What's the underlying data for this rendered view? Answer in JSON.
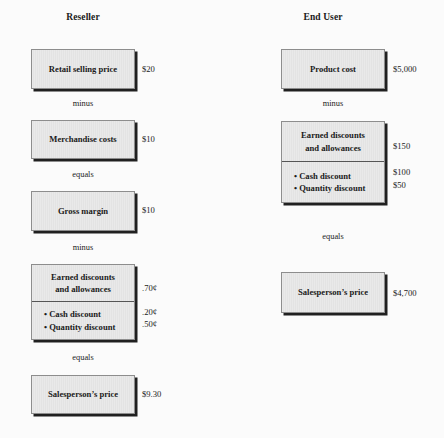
{
  "columns": [
    {
      "id": "reseller",
      "header": "Reseller",
      "boxes": [
        {
          "name": "retail-selling-price",
          "sections": [
            {
              "lines": [
                "Retail selling price"
              ]
            }
          ],
          "values": [
            "$20"
          ]
        },
        {
          "name": "merchandise-costs",
          "sections": [
            {
              "lines": [
                "Merchandise costs"
              ]
            }
          ],
          "values": [
            "$10"
          ]
        },
        {
          "name": "gross-margin",
          "sections": [
            {
              "lines": [
                "Gross margin"
              ]
            }
          ],
          "values": [
            "$10"
          ]
        },
        {
          "name": "earned-discounts-and-allowances",
          "sections": [
            {
              "lines": [
                "Earned discounts",
                "and allowances"
              ]
            },
            {
              "lines": [
                "• Cash discount",
                "• Quantity discount"
              ],
              "bullets": true
            }
          ],
          "values": [
            ".70¢",
            ".20¢",
            ".50¢"
          ]
        },
        {
          "name": "salespersons-price",
          "sections": [
            {
              "lines": [
                "Salesperson’s price"
              ]
            }
          ],
          "values": [
            "$9.30"
          ]
        }
      ],
      "operators": [
        "minus",
        "equals",
        "minus",
        "equals"
      ]
    },
    {
      "id": "end-user",
      "header": "End User",
      "boxes": [
        {
          "name": "product-cost",
          "sections": [
            {
              "lines": [
                "Product cost"
              ]
            }
          ],
          "values": [
            "$5,000"
          ]
        },
        {
          "name": "earned-discounts-and-allowances",
          "sections": [
            {
              "lines": [
                "Earned discounts",
                "and allowances"
              ]
            },
            {
              "lines": [
                "• Cash discount",
                "• Quantity discount"
              ],
              "bullets": true
            }
          ],
          "values": [
            "$150",
            "$100",
            "$50"
          ]
        },
        {
          "name": "salespersons-price",
          "sections": [
            {
              "lines": [
                "Salesperson’s price"
              ]
            }
          ],
          "values": [
            "$4,700"
          ]
        }
      ],
      "operators": [
        "minus",
        "equals"
      ]
    }
  ]
}
